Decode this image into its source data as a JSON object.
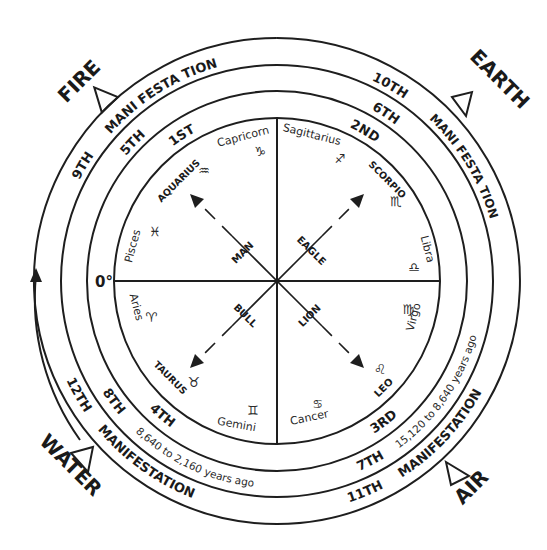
{
  "elements": [
    {
      "name": "FIRE",
      "position": "top-left",
      "symbol": "triangle-up"
    },
    {
      "name": "EARTH",
      "position": "top-right",
      "symbol": "triangle-down"
    },
    {
      "name": "WATER",
      "position": "bottom-left",
      "symbol": "triangle-up"
    },
    {
      "name": "AIR",
      "position": "bottom-right",
      "symbol": "triangle-down"
    }
  ],
  "labels": {
    "fire": "FIRE",
    "earth": "EARTH",
    "water": "WATER",
    "air": "AIR",
    "zero_degree": "0°",
    "manifestation": "MANIFESTATION",
    "mani_festation_tl": "MANI FESTA TION",
    "mani_festation_tr": "MANI FESTA TION",
    "mani_festation_bl": "MANIFESTATION",
    "mani_festation_br": "MANIFESTATION"
  },
  "rings": {
    "outer": [
      "9TH",
      "10TH",
      "11TH",
      "12TH"
    ],
    "middle": [
      "5TH",
      "6TH",
      "7TH",
      "8TH"
    ],
    "inner": [
      "1ST",
      "2ND",
      "3RD",
      "4TH"
    ]
  },
  "timespans": {
    "bottom_left": "8,640 to 2,160 years ago",
    "bottom_right": "15,120 to 8,640 years ago"
  },
  "zodiac": [
    {
      "name": "Capricorn",
      "glyph": "♑"
    },
    {
      "name": "Sagittarius",
      "glyph": "♐"
    },
    {
      "name": "SCORPIO",
      "glyph": "♏"
    },
    {
      "name": "Libra",
      "glyph": "♎"
    },
    {
      "name": "Virgo",
      "glyph": "♍"
    },
    {
      "name": "LEO",
      "glyph": "♌"
    },
    {
      "name": "Cancer",
      "glyph": "♋"
    },
    {
      "name": "Gemini",
      "glyph": "♊"
    },
    {
      "name": "TAURUS",
      "glyph": "♉"
    },
    {
      "name": "Aries",
      "glyph": "♈"
    },
    {
      "name": "Pisces",
      "glyph": "♓"
    },
    {
      "name": "AQUARIUS",
      "glyph": "♒"
    }
  ],
  "creatures": {
    "man": "MAN",
    "eagle": "EAGLE",
    "lion": "LION",
    "bull": "BULL"
  },
  "colors": {
    "ink": "#1e1e1e",
    "paper": "#ffffff"
  }
}
